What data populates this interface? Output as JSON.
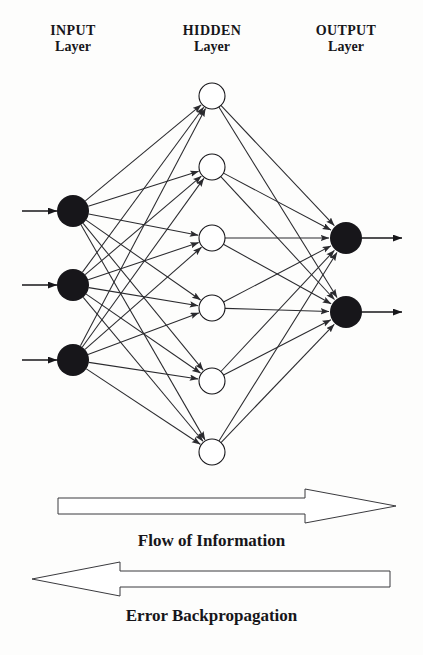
{
  "diagram": {
    "type": "neural-network",
    "labels": {
      "input": {
        "top": "INPUT",
        "bottom": "Layer"
      },
      "hidden": {
        "top": "HIDDEN",
        "bottom": "Layer"
      },
      "output": {
        "top": "OUTPUT",
        "bottom": "Layer"
      }
    },
    "captions": {
      "forward": "Flow of Information",
      "backward": "Error Backpropagation"
    },
    "colors": {
      "node_filled": "#17161a",
      "node_hollow_fill": "#ffffff",
      "node_stroke": "#17161a",
      "connection": "#2a2a2e",
      "arrow_outline": "#3a3a3e",
      "arrow_fill": "#ffffff",
      "background": "#fdfdfc",
      "text": "#17161a"
    },
    "layers": [
      {
        "name": "input",
        "node_count": 3,
        "node_style": "filled",
        "node_radius": 16,
        "x": 73,
        "nodes": [
          {
            "id": "i1",
            "cy": 211
          },
          {
            "id": "i2",
            "cy": 285
          },
          {
            "id": "i3",
            "cy": 360
          }
        ]
      },
      {
        "name": "hidden",
        "node_count": 6,
        "node_style": "hollow",
        "node_radius": 13,
        "x": 212,
        "nodes": [
          {
            "id": "h1",
            "cy": 96
          },
          {
            "id": "h2",
            "cy": 167
          },
          {
            "id": "h3",
            "cy": 238
          },
          {
            "id": "h4",
            "cy": 308
          },
          {
            "id": "h5",
            "cy": 381
          },
          {
            "id": "h6",
            "cy": 452
          }
        ]
      },
      {
        "name": "output",
        "node_count": 2,
        "node_style": "filled",
        "node_radius": 16,
        "x": 346,
        "nodes": [
          {
            "id": "o1",
            "cy": 238
          },
          {
            "id": "o2",
            "cy": 312
          }
        ]
      }
    ],
    "external_arrows": {
      "inputs": [
        {
          "from_x": 22,
          "to_x": 57,
          "y": 211
        },
        {
          "from_x": 22,
          "to_x": 57,
          "y": 285
        },
        {
          "from_x": 22,
          "to_x": 57,
          "y": 360
        }
      ],
      "outputs": [
        {
          "from_x": 362,
          "to_x": 402,
          "y": 238
        },
        {
          "from_x": 362,
          "to_x": 402,
          "y": 312
        }
      ]
    },
    "connections": {
      "fully_connected": true,
      "input_to_hidden_count": 18,
      "hidden_to_output_count": 12,
      "arrowheads": true
    },
    "flow_arrows": [
      {
        "id": "forward-arrow",
        "direction": "right",
        "body_from_x": 58,
        "body_to_x": 305,
        "tip_x": 396,
        "center_y": 26,
        "body_half_height": 8,
        "head_half_height": 17
      },
      {
        "id": "backward-arrow",
        "direction": "left",
        "body_from_x": 390,
        "body_to_x": 120,
        "tip_x": 32,
        "center_y": 99,
        "body_half_height": 8,
        "head_half_height": 17
      }
    ]
  }
}
